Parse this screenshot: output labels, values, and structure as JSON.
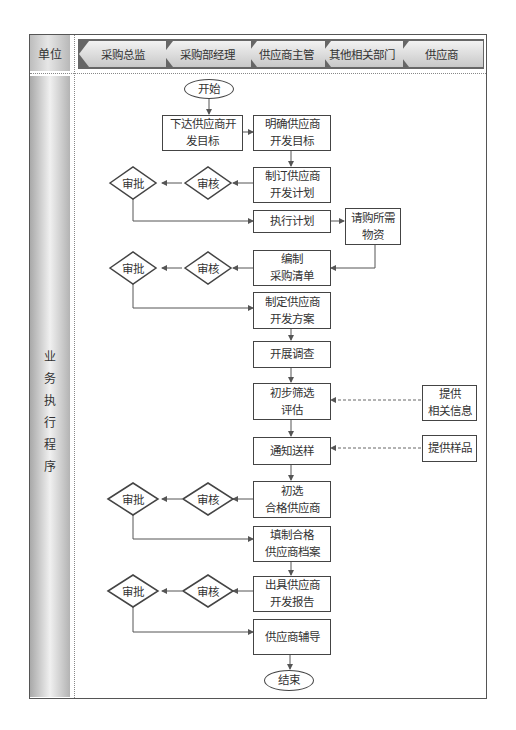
{
  "header": {
    "unit_label": "单位",
    "lanes": [
      "采购总监",
      "采购部经理",
      "供应商主管",
      "其他相关部门",
      "供应商"
    ]
  },
  "sidebar": {
    "label_chars": [
      "业",
      "务",
      "执",
      "行",
      "程",
      "序"
    ]
  },
  "nodes": {
    "start": "开始",
    "n1": [
      "下达供应商开",
      "发目标"
    ],
    "n2": [
      "明确供应商",
      "开发目标"
    ],
    "n3": [
      "制订供应商",
      "开发计划"
    ],
    "n4": "执行计划",
    "n5": [
      "请购所需",
      "物资"
    ],
    "n6": [
      "编制",
      "采购清单"
    ],
    "n7": [
      "制定供应商",
      "开发方案"
    ],
    "n8": "开展调查",
    "n9": [
      "初步筛选",
      "评估"
    ],
    "n10": [
      "提供",
      "相关信息"
    ],
    "n11": "通知送样",
    "n12": "提供样品",
    "n13": [
      "初选",
      "合格供应商"
    ],
    "n14": [
      "填制合格",
      "供应商档案"
    ],
    "n15": [
      "出具供应商",
      "开发报告"
    ],
    "n16": "供应商辅导",
    "end": "结束",
    "review": "审核",
    "approve": "审批"
  },
  "colors": {
    "line": "#555555",
    "box_border": "#444444",
    "lane_dark": "#666666"
  }
}
